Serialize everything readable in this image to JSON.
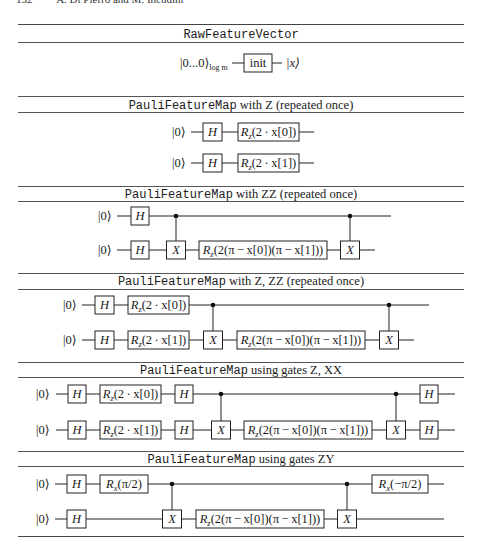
{
  "running_head": {
    "page_number": "152",
    "authors": "A. Di Pierro and M. Incudini"
  },
  "table": {
    "rules": [
      24,
      42,
      96,
      112,
      186,
      201,
      273,
      289,
      362,
      377,
      451,
      466,
      536
    ],
    "sections": [
      {
        "id": "raw-feature-vector",
        "caption_mono": "RawFeatureVector",
        "caption_rest": "",
        "caption_y": 27,
        "wires": [
          {
            "y": 63,
            "x1": 232,
            "x2": 282,
            "ket": "",
            "ket_label": "|0...0⟩",
            "ket_sub": "log m",
            "ket_x": 180,
            "out_label": "|x⟩",
            "out_x": 286
          }
        ],
        "gates": [
          {
            "type": "box",
            "wire": 0,
            "x": 244,
            "w": 28,
            "label": "init",
            "italic": false
          }
        ],
        "cnots": []
      },
      {
        "id": "pauli-z",
        "caption_mono": "PauliFeatureMap",
        "caption_rest": " with Z (repeated once)",
        "caption_y": 98,
        "wires": [
          {
            "y": 132,
            "x1": 191,
            "x2": 314,
            "ket_label": "|0⟩",
            "ket_x": 172
          },
          {
            "y": 163,
            "x1": 191,
            "x2": 314,
            "ket_label": "|0⟩",
            "ket_x": 172
          }
        ],
        "gates": [
          {
            "type": "box",
            "wire": 0,
            "x": 203,
            "w": 19,
            "label": "H",
            "italic": true
          },
          {
            "type": "box",
            "wire": 0,
            "x": 238,
            "w": 61,
            "label": "R_z(2 · x[0])"
          },
          {
            "type": "box",
            "wire": 1,
            "x": 203,
            "w": 19,
            "label": "H",
            "italic": true
          },
          {
            "type": "box",
            "wire": 1,
            "x": 238,
            "w": 61,
            "label": "R_z(2 · x[1])"
          }
        ],
        "cnots": []
      },
      {
        "id": "pauli-zz",
        "caption_mono": "PauliFeatureMap",
        "caption_rest": " with ZZ (repeated once)",
        "caption_y": 187,
        "wires": [
          {
            "y": 216,
            "x1": 117,
            "x2": 391,
            "ket_label": "|0⟩",
            "ket_x": 98
          },
          {
            "y": 250,
            "x1": 117,
            "x2": 375,
            "ket_label": "|0⟩",
            "ket_x": 98
          }
        ],
        "gates": [
          {
            "type": "box",
            "wire": 0,
            "x": 131,
            "w": 18,
            "label": "H",
            "italic": true
          },
          {
            "type": "box",
            "wire": 1,
            "x": 131,
            "w": 18,
            "label": "H",
            "italic": true
          },
          {
            "type": "box",
            "wire": 1,
            "x": 199,
            "w": 128,
            "label": "R_z(2(π − x[0])(π − x[1]))"
          }
        ],
        "cnots": [
          {
            "ctrl": 0,
            "tgt": 1,
            "x": 176,
            "label": "X"
          },
          {
            "ctrl": 0,
            "tgt": 1,
            "x": 350,
            "label": "X"
          }
        ]
      },
      {
        "id": "pauli-z-zz",
        "caption_mono": "PauliFeatureMap",
        "caption_rest": " with Z, ZZ (repeated once)",
        "caption_y": 274,
        "wires": [
          {
            "y": 305,
            "x1": 82,
            "x2": 429,
            "ket_label": "|0⟩",
            "ket_x": 63
          },
          {
            "y": 340,
            "x1": 82,
            "x2": 414,
            "ket_label": "|0⟩",
            "ket_x": 63
          }
        ],
        "gates": [
          {
            "type": "box",
            "wire": 0,
            "x": 95,
            "w": 19,
            "label": "H",
            "italic": true
          },
          {
            "type": "box",
            "wire": 0,
            "x": 128,
            "w": 61,
            "label": "R_z(2 · x[0])"
          },
          {
            "type": "box",
            "wire": 1,
            "x": 95,
            "w": 19,
            "label": "H",
            "italic": true
          },
          {
            "type": "box",
            "wire": 1,
            "x": 128,
            "w": 61,
            "label": "R_z(2 · x[1])"
          },
          {
            "type": "box",
            "wire": 1,
            "x": 237,
            "w": 128,
            "label": "R_z(2(π − x[0])(π − x[1]))"
          }
        ],
        "cnots": [
          {
            "ctrl": 0,
            "tgt": 1,
            "x": 213,
            "label": "X"
          },
          {
            "ctrl": 0,
            "tgt": 1,
            "x": 389,
            "label": "X"
          }
        ]
      },
      {
        "id": "pauli-z-xx",
        "caption_mono": "PauliFeatureMap",
        "caption_rest": " using gates Z, XX",
        "caption_y": 363,
        "wires": [
          {
            "y": 394,
            "x1": 56,
            "x2": 455,
            "ket_label": "|0⟩",
            "ket_x": 36
          },
          {
            "y": 430,
            "x1": 56,
            "x2": 455,
            "ket_label": "|0⟩",
            "ket_x": 36
          }
        ],
        "gates": [
          {
            "type": "box",
            "wire": 0,
            "x": 68,
            "w": 18,
            "label": "H",
            "italic": true
          },
          {
            "type": "box",
            "wire": 0,
            "x": 100,
            "w": 61,
            "label": "R_z(2 · x[0])"
          },
          {
            "type": "box",
            "wire": 0,
            "x": 175,
            "w": 18,
            "label": "H",
            "italic": true
          },
          {
            "type": "box",
            "wire": 0,
            "x": 420,
            "w": 18,
            "label": "H",
            "italic": true
          },
          {
            "type": "box",
            "wire": 1,
            "x": 68,
            "w": 18,
            "label": "H",
            "italic": true
          },
          {
            "type": "box",
            "wire": 1,
            "x": 100,
            "w": 61,
            "label": "R_z(2 · x[1])"
          },
          {
            "type": "box",
            "wire": 1,
            "x": 175,
            "w": 18,
            "label": "H",
            "italic": true
          },
          {
            "type": "box",
            "wire": 1,
            "x": 244,
            "w": 128,
            "label": "R_z(2(π − x[0])(π − x[1]))"
          },
          {
            "type": "box",
            "wire": 1,
            "x": 420,
            "w": 18,
            "label": "H",
            "italic": true
          }
        ],
        "cnots": [
          {
            "ctrl": 0,
            "tgt": 1,
            "x": 221,
            "label": "X"
          },
          {
            "ctrl": 0,
            "tgt": 1,
            "x": 396,
            "label": "X"
          }
        ]
      },
      {
        "id": "pauli-zy",
        "caption_mono": "PauliFeatureMap",
        "caption_rest": " using gates ZY",
        "caption_y": 452,
        "wires": [
          {
            "y": 484,
            "x1": 55,
            "x2": 444,
            "ket_label": "|0⟩",
            "ket_x": 36
          },
          {
            "y": 519,
            "x1": 55,
            "x2": 444,
            "ket_label": "|0⟩",
            "ket_x": 36
          }
        ],
        "gates": [
          {
            "type": "box",
            "wire": 0,
            "x": 67,
            "w": 19,
            "label": "H",
            "italic": true
          },
          {
            "type": "box",
            "wire": 0,
            "x": 100,
            "w": 48,
            "label": "R_x(π/2)"
          },
          {
            "type": "box",
            "wire": 0,
            "x": 372,
            "w": 56,
            "label": "R_x(−π/2)"
          },
          {
            "type": "box",
            "wire": 1,
            "x": 67,
            "w": 19,
            "label": "H",
            "italic": true
          },
          {
            "type": "box",
            "wire": 1,
            "x": 196,
            "w": 128,
            "label": "R_z(2(π − x[0])(π − x[1]))"
          }
        ],
        "cnots": [
          {
            "ctrl": 0,
            "tgt": 1,
            "x": 172,
            "label": "X"
          },
          {
            "ctrl": 0,
            "tgt": 1,
            "x": 347,
            "label": "X"
          }
        ]
      }
    ]
  }
}
